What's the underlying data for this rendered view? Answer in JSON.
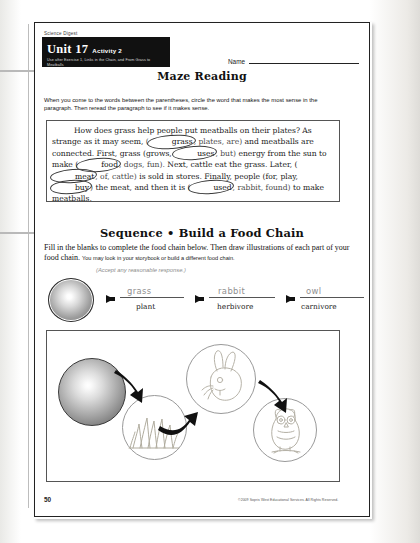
{
  "page": {
    "publisher_line": "Science Digest",
    "unit_number": "Unit 17",
    "activity": "Activity 2",
    "unit_subtitle": "Use after Exercise 1, Links in the Chain, and From Grass to Meatballs",
    "name_label": "Name",
    "page_number": "50",
    "copyright": "©2009 Sopris West Educational Services. All Rights Reserved."
  },
  "maze": {
    "title": "Maze Reading",
    "instructions": "When you come to the words between the parentheses, circle the word that makes the most sense in the paragraph. Then reread the paragraph to see if it makes sense.",
    "paragraph": {
      "s1": "How does grass help people put meatballs on their plates?  As strange as it may seem,",
      "c1_answer": "grass",
      "c1_rest": ", plates, are)",
      "s2": "and meatballs are connected. First, grass (grows,",
      "c2_answer": "uses",
      "c2_rest": ", but)",
      "s3": "energy from the sun to make (",
      "c3_answer": "food",
      "c3_rest": ", dogs, fun).",
      "s4": "Next, cattle eat the grass.  Later, (",
      "c4_answer": "meat",
      "c4_rest": ", of, cattle)",
      "s5": "is sold in stores. Finally, people (for, play,",
      "c5_answer": "buy",
      "c5_rest": ")",
      "s6": "the meat, and then it is (",
      "c6_answer": "used",
      "c6_rest": ", rabbit, found)",
      "s7": "to make meatballs."
    }
  },
  "sequence": {
    "title": "Sequence • Build a Food Chain",
    "instructions_main": "Fill in the blanks to complete the food chain below.  Then draw illustrations of each part of your food chain.",
    "instructions_small": "You may look in your storybook or build a different food chain.",
    "accept_note": "(Accept any reasonable response.)",
    "chain": [
      {
        "answer": "grass",
        "label": "plant"
      },
      {
        "answer": "rabbit",
        "label": "herbivore"
      },
      {
        "answer": "owl",
        "label": "carnivore"
      }
    ],
    "illustrations": [
      {
        "name": "sun"
      },
      {
        "name": "grass"
      },
      {
        "name": "rabbit"
      },
      {
        "name": "owl"
      }
    ]
  },
  "colors": {
    "ink": "#111111",
    "rule": "#555555",
    "handwriting": "#8f8f8f",
    "pointer": "#b9b9b9"
  }
}
